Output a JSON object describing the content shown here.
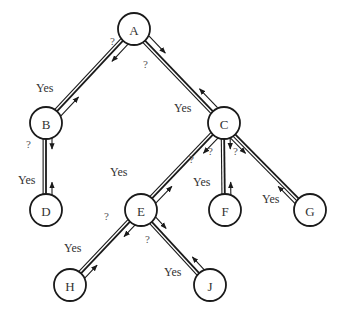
{
  "diagram": {
    "type": "tree",
    "colors": {
      "stroke": "#1a1a1a",
      "text": "#333333",
      "background": "#ffffff"
    },
    "node_radius": 16,
    "nodes": [
      {
        "id": "A",
        "label": "A",
        "x": 134,
        "y": 29
      },
      {
        "id": "B",
        "label": "B",
        "x": 46,
        "y": 123
      },
      {
        "id": "C",
        "label": "C",
        "x": 224,
        "y": 123
      },
      {
        "id": "D",
        "label": "D",
        "x": 46,
        "y": 210
      },
      {
        "id": "E",
        "label": "E",
        "x": 141,
        "y": 210
      },
      {
        "id": "F",
        "label": "F",
        "x": 225,
        "y": 210
      },
      {
        "id": "G",
        "label": "G",
        "x": 310,
        "y": 210
      },
      {
        "id": "H",
        "label": "H",
        "x": 70,
        "y": 285
      },
      {
        "id": "J",
        "label": "J",
        "x": 210,
        "y": 285
      }
    ],
    "edges": [
      {
        "from": "A",
        "to": "B",
        "query_label": "?",
        "reply_label": "Yes",
        "query_side": "left",
        "q_pos": [
          110,
          45
        ],
        "yes_pos": [
          36,
          92
        ]
      },
      {
        "from": "A",
        "to": "C",
        "query_label": "?",
        "reply_label": "Yes",
        "query_side": "left",
        "q_pos": [
          143,
          68
        ],
        "yes_pos": [
          174,
          112
        ]
      },
      {
        "from": "B",
        "to": "D",
        "query_label": "?",
        "reply_label": "Yes",
        "query_side": "left",
        "q_pos": [
          26,
          148
        ],
        "yes_pos": [
          18,
          184
        ]
      },
      {
        "from": "C",
        "to": "E",
        "query_label": "?",
        "reply_label": "Yes",
        "query_side": "left",
        "q_pos": [
          189,
          163
        ],
        "yes_pos": [
          110,
          176
        ]
      },
      {
        "from": "C",
        "to": "F",
        "query_label": "?",
        "reply_label": "Yes",
        "query_side": "left",
        "q_pos": [
          208,
          155
        ],
        "yes_pos": [
          193,
          186
        ]
      },
      {
        "from": "C",
        "to": "G",
        "query_label": "?",
        "reply_label": "Yes",
        "query_side": "right",
        "q_pos": [
          233,
          155
        ],
        "yes_pos": [
          262,
          203
        ]
      },
      {
        "from": "E",
        "to": "H",
        "query_label": "?",
        "reply_label": "Yes",
        "query_side": "left",
        "q_pos": [
          104,
          220
        ],
        "yes_pos": [
          64,
          252
        ]
      },
      {
        "from": "E",
        "to": "J",
        "query_label": "?",
        "reply_label": "Yes",
        "query_side": "left",
        "q_pos": [
          145,
          243
        ],
        "yes_pos": [
          164,
          276
        ]
      }
    ]
  }
}
